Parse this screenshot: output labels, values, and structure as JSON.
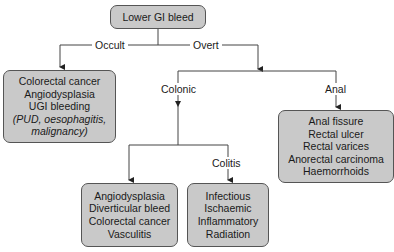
{
  "diagram": {
    "root": {
      "label": "Lower GI bleed"
    },
    "branches": {
      "occult": {
        "label": "Occult"
      },
      "overt": {
        "label": "Overt"
      }
    },
    "occult_box": {
      "items": [
        "Colorectal cancer",
        "Angiodysplasia",
        "UGI bleeding"
      ],
      "note_lines": [
        "(PUD, oesophagitis,",
        "malignancy)"
      ]
    },
    "overt_branches": {
      "colonic": {
        "label": "Colonic"
      },
      "anal": {
        "label": "Anal"
      }
    },
    "anal_box": {
      "items": [
        "Anal fissure",
        "Rectal ulcer",
        "Rectal varices",
        "Anorectal carcinoma",
        "Haemorrhoids"
      ]
    },
    "colonic_branches": {
      "colitis": {
        "label": "Colitis"
      }
    },
    "colonic_box": {
      "items": [
        "Angiodysplasia",
        "Diverticular bleed",
        "Colorectal cancer",
        "Vasculitis"
      ]
    },
    "colitis_box": {
      "items": [
        "Infectious",
        "Ischaemic",
        "Inflammatory",
        "Radiation"
      ]
    }
  },
  "colors": {
    "box_fill": "#c9c9c9",
    "line": "#444444",
    "background": "#ffffff"
  }
}
